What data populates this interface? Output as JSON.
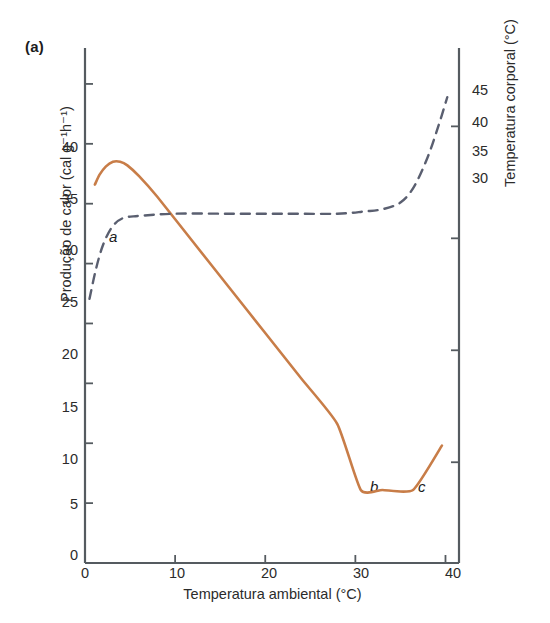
{
  "panel": {
    "label": "(a)"
  },
  "chart_data": {
    "type": "line",
    "title": "",
    "subtitle": "",
    "xlabel": "Temperatura ambiental (°C)",
    "ylabel": "Produção de calor (cal g⁻¹h⁻¹)",
    "y2label": "Temperatura corporal (°C)",
    "xlim": [
      0,
      41.5
    ],
    "ylim": [
      0,
      43
    ],
    "y2lim": [
      25.5,
      48.5
    ],
    "grid": false,
    "legend": "none",
    "xticks": [
      0,
      10,
      20,
      30,
      40
    ],
    "xticklabels": [
      "0",
      "10",
      "20",
      "30",
      "40"
    ],
    "yticks": [
      0,
      5,
      10,
      15,
      20,
      25,
      30,
      35,
      40
    ],
    "yticklabels": [
      "0",
      "5",
      "10",
      "15",
      "20",
      "25",
      "30",
      "35",
      "40"
    ],
    "y2ticks": [
      30,
      35,
      40,
      45
    ],
    "y2ticklabels": [
      "30",
      "35",
      "40",
      "45"
    ],
    "annotations": [
      {
        "text": "a",
        "x": 3.2,
        "y": 30.3
      },
      {
        "text": "b",
        "x": 31.6,
        "y": 7.6
      },
      {
        "text": "c",
        "x": 36.2,
        "y": 7.6
      }
    ],
    "series": [
      {
        "name": "Produção de calor",
        "axis": "left",
        "style": "solid",
        "color": "#c87d48",
        "x": [
          1.1,
          1.6,
          2.3,
          3.1,
          3.9,
          4.7,
          6.0,
          8.0,
          12.0,
          16.0,
          20.0,
          24.0,
          28.0,
          30.6,
          33.0,
          36.4,
          39.6
        ],
        "values": [
          31.6,
          32.4,
          33.1,
          33.5,
          33.5,
          33.2,
          32.3,
          30.6,
          26.8,
          23.0,
          19.2,
          15.4,
          11.6,
          6.1,
          6.1,
          6.1,
          9.8
        ]
      },
      {
        "name": "Temperatura corporal",
        "axis": "right",
        "style": "dashed",
        "color": "#5a5f70",
        "x": [
          0.5,
          1.2,
          2.0,
          3.0,
          4.2,
          6.0,
          10.0,
          16.0,
          22.0,
          28.0,
          31.0,
          33.0,
          35.0,
          36.5,
          38.0,
          39.2,
          40.2
        ],
        "values": [
          37.3,
          38.6,
          39.7,
          40.5,
          40.9,
          41.0,
          41.1,
          41.1,
          41.1,
          41.1,
          41.2,
          41.3,
          41.6,
          42.3,
          43.6,
          45.0,
          46.3
        ]
      }
    ]
  },
  "axes": {
    "left_axis_name": "heat-production-axis",
    "right_axis_name": "body-temperature-axis",
    "bottom_axis_name": "ambient-temperature-axis"
  }
}
